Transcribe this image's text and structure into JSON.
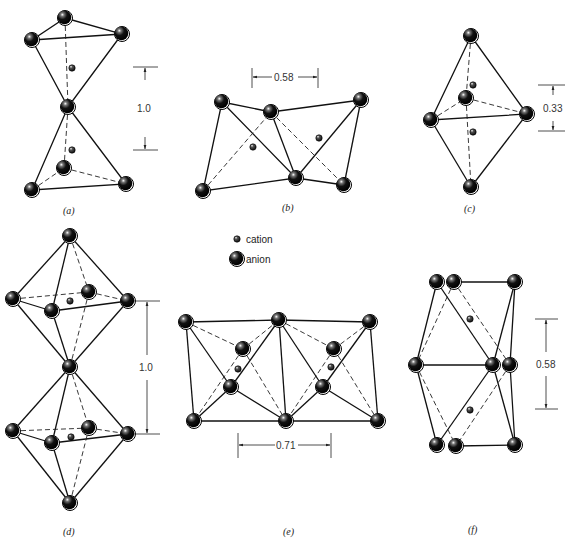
{
  "figure": {
    "legend": {
      "cation": "cation",
      "anion": "anion"
    },
    "panels": [
      {
        "id": "a",
        "label": "(a)",
        "dimension": "1.0",
        "description": "two tetrahedra sharing a corner"
      },
      {
        "id": "b",
        "label": "(b)",
        "dimension": "0.58",
        "description": "two tetrahedra sharing an edge"
      },
      {
        "id": "c",
        "label": "(c)",
        "dimension": "0.33",
        "description": "two tetrahedra sharing a face"
      },
      {
        "id": "d",
        "label": "(d)",
        "dimension": "1.0",
        "description": "two octahedra sharing a corner"
      },
      {
        "id": "e",
        "label": "(e)",
        "dimension": "0.71",
        "description": "two octahedra sharing an edge"
      },
      {
        "id": "f",
        "label": "(f)",
        "dimension": "0.58",
        "description": "two octahedra sharing a face"
      }
    ]
  }
}
